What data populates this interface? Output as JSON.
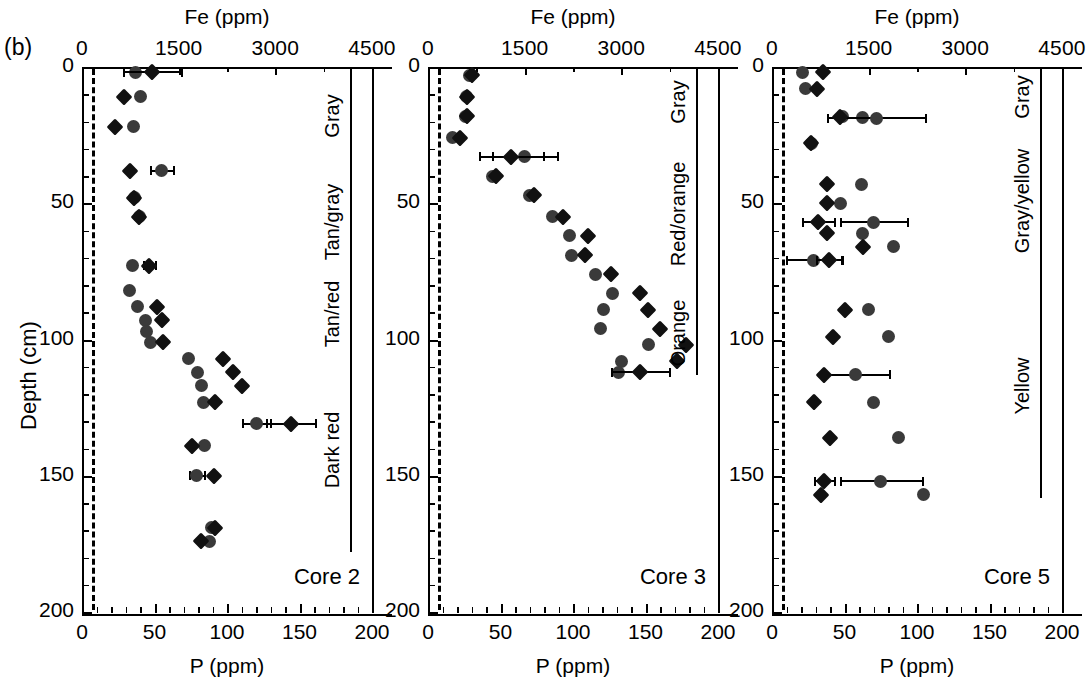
{
  "figure": {
    "panel_letter": "(b)",
    "y_axis_title": "Depth (cm)",
    "y_ticks": [
      "0",
      "50",
      "100",
      "150",
      "200"
    ],
    "y_tick_values": [
      0,
      50,
      100,
      150,
      200
    ],
    "y_minor_step": 10,
    "top_axis_title": "Fe (ppm)",
    "top_ticks": [
      "0",
      "1500",
      "3000",
      "4500"
    ],
    "top_tick_values": [
      0,
      1500,
      3000,
      4500
    ],
    "bottom_axis_title": "P (ppm)",
    "bottom_ticks": [
      "0",
      "50",
      "100",
      "150",
      "200"
    ],
    "bottom_tick_values": [
      0,
      50,
      100,
      150,
      200
    ],
    "bottom_minor_step": 10,
    "marker_fe_color": "#3a3a3a",
    "marker_p_color": "#111111",
    "detection_limit_P": 7
  },
  "chart_data": {
    "type": "scatter",
    "title": "",
    "xlabel": "P (ppm)",
    "ylabel": "Depth (cm)",
    "xlabel_top": "Fe (ppm)",
    "ylim": [
      0,
      200
    ],
    "xlim_bottom": [
      0,
      200
    ],
    "xlim_top": [
      0,
      4500
    ],
    "grid": false,
    "legend": "none",
    "y_inverted": true,
    "panels": [
      {
        "name": "Core 2",
        "zones": [
          {
            "label": "Gray",
            "top": 0,
            "bottom": 36
          },
          {
            "label": "Tan/gray",
            "top": 36,
            "bottom": 78
          },
          {
            "label": "Tan/red",
            "top": 78,
            "bottom": 103
          },
          {
            "label": "Dark red",
            "top": 103,
            "bottom": 178
          }
        ],
        "fe_series": {
          "name": "Fe (ppm)",
          "marker": "circle",
          "points": [
            {
              "depth": 2,
              "value": 830,
              "err": 0
            },
            {
              "depth": 11,
              "value": 900,
              "err": 0
            },
            {
              "depth": 22,
              "value": 800,
              "err": 0
            },
            {
              "depth": 38,
              "value": 1230,
              "err": 180
            },
            {
              "depth": 48,
              "value": 820,
              "err": 0
            },
            {
              "depth": 55,
              "value": 890,
              "err": 0
            },
            {
              "depth": 73,
              "value": 780,
              "err": 0
            },
            {
              "depth": 82,
              "value": 740,
              "err": 0
            },
            {
              "depth": 88,
              "value": 860,
              "err": 0
            },
            {
              "depth": 93,
              "value": 980,
              "err": 0
            },
            {
              "depth": 97,
              "value": 1000,
              "err": 0
            },
            {
              "depth": 101,
              "value": 1060,
              "err": 0
            },
            {
              "depth": 107,
              "value": 1660,
              "err": 0
            },
            {
              "depth": 112,
              "value": 1790,
              "err": 0
            },
            {
              "depth": 117,
              "value": 1860,
              "err": 0
            },
            {
              "depth": 123,
              "value": 1880,
              "err": 0
            },
            {
              "depth": 131,
              "value": 2700,
              "err": 220
            },
            {
              "depth": 139,
              "value": 1900,
              "err": 0
            },
            {
              "depth": 150,
              "value": 1780,
              "err": 120
            },
            {
              "depth": 169,
              "value": 2010,
              "err": 0
            },
            {
              "depth": 174,
              "value": 1980,
              "err": 0
            }
          ]
        },
        "p_series": {
          "name": "P (ppm)",
          "marker": "diamond",
          "points": [
            {
              "depth": 2,
              "value": 48,
              "err": 20
            },
            {
              "depth": 11,
              "value": 29,
              "err": 0
            },
            {
              "depth": 22,
              "value": 23,
              "err": 0
            },
            {
              "depth": 38,
              "value": 33,
              "err": 0
            },
            {
              "depth": 48,
              "value": 36,
              "err": 0
            },
            {
              "depth": 55,
              "value": 39,
              "err": 0
            },
            {
              "depth": 73,
              "value": 46,
              "err": 4
            },
            {
              "depth": 88,
              "value": 52,
              "err": 0
            },
            {
              "depth": 93,
              "value": 55,
              "err": 0
            },
            {
              "depth": 101,
              "value": 56,
              "err": 0
            },
            {
              "depth": 107,
              "value": 97,
              "err": 0
            },
            {
              "depth": 112,
              "value": 104,
              "err": 0
            },
            {
              "depth": 117,
              "value": 110,
              "err": 0
            },
            {
              "depth": 123,
              "value": 92,
              "err": 0
            },
            {
              "depth": 131,
              "value": 144,
              "err": 17
            },
            {
              "depth": 139,
              "value": 76,
              "err": 0
            },
            {
              "depth": 150,
              "value": 91,
              "err": 0
            },
            {
              "depth": 169,
              "value": 92,
              "err": 0
            },
            {
              "depth": 174,
              "value": 82,
              "err": 0
            }
          ]
        }
      },
      {
        "name": "Core 3",
        "zones": [
          {
            "label": "Gray",
            "top": 0,
            "bottom": 26
          },
          {
            "label": "Red/orange",
            "top": 26,
            "bottom": 82
          },
          {
            "label": "Orange",
            "top": 82,
            "bottom": 113
          }
        ],
        "fe_series": {
          "name": "Fe (ppm)",
          "marker": "circle",
          "points": [
            {
              "depth": 3,
              "value": 640,
              "err": 0
            },
            {
              "depth": 11,
              "value": 590,
              "err": 0
            },
            {
              "depth": 18,
              "value": 580,
              "err": 0
            },
            {
              "depth": 26,
              "value": 380,
              "err": 0
            },
            {
              "depth": 33,
              "value": 1500,
              "err": 500
            },
            {
              "depth": 40,
              "value": 1000,
              "err": 0
            },
            {
              "depth": 47,
              "value": 1580,
              "err": 0
            },
            {
              "depth": 55,
              "value": 1930,
              "err": 0
            },
            {
              "depth": 62,
              "value": 2200,
              "err": 0
            },
            {
              "depth": 69,
              "value": 2230,
              "err": 0
            },
            {
              "depth": 76,
              "value": 2600,
              "err": 0
            },
            {
              "depth": 83,
              "value": 2870,
              "err": 0
            },
            {
              "depth": 89,
              "value": 2730,
              "err": 0
            },
            {
              "depth": 96,
              "value": 2670,
              "err": 0
            },
            {
              "depth": 102,
              "value": 3420,
              "err": 0
            },
            {
              "depth": 108,
              "value": 3000,
              "err": 0
            },
            {
              "depth": 112,
              "value": 2960,
              "err": 0
            }
          ]
        },
        "p_series": {
          "name": "P (ppm)",
          "marker": "diamond",
          "points": [
            {
              "depth": 3,
              "value": 30,
              "err": 0
            },
            {
              "depth": 11,
              "value": 27,
              "err": 0
            },
            {
              "depth": 18,
              "value": 27,
              "err": 0
            },
            {
              "depth": 26,
              "value": 22,
              "err": 0
            },
            {
              "depth": 33,
              "value": 57,
              "err": 22
            },
            {
              "depth": 40,
              "value": 47,
              "err": 0
            },
            {
              "depth": 47,
              "value": 73,
              "err": 0
            },
            {
              "depth": 55,
              "value": 93,
              "err": 0
            },
            {
              "depth": 62,
              "value": 110,
              "err": 0
            },
            {
              "depth": 69,
              "value": 108,
              "err": 0
            },
            {
              "depth": 76,
              "value": 126,
              "err": 0
            },
            {
              "depth": 83,
              "value": 146,
              "err": 0
            },
            {
              "depth": 89,
              "value": 152,
              "err": 0
            },
            {
              "depth": 96,
              "value": 160,
              "err": 0
            },
            {
              "depth": 102,
              "value": 178,
              "err": 0
            },
            {
              "depth": 108,
              "value": 172,
              "err": 0
            },
            {
              "depth": 112,
              "value": 146,
              "err": 20
            }
          ]
        }
      },
      {
        "name": "Core 5",
        "zones": [
          {
            "label": "Gray",
            "top": 0,
            "bottom": 22
          },
          {
            "label": "Gray/yellow",
            "top": 22,
            "bottom": 76
          },
          {
            "label": "Yellow",
            "top": 76,
            "bottom": 158
          }
        ],
        "fe_series": {
          "name": "Fe (ppm)",
          "marker": "circle",
          "points": [
            {
              "depth": 2,
              "value": 470,
              "err": 0
            },
            {
              "depth": 8,
              "value": 520,
              "err": 0
            },
            {
              "depth": 18,
              "value": 1090,
              "err": 0
            },
            {
              "depth": 18.5,
              "value": 1400,
              "err": 0
            },
            {
              "depth": 18.8,
              "value": 1620,
              "err": 760
            },
            {
              "depth": 28,
              "value": 620,
              "err": 0
            },
            {
              "depth": 43,
              "value": 1390,
              "err": 0
            },
            {
              "depth": 50,
              "value": 1060,
              "err": 0
            },
            {
              "depth": 57,
              "value": 1580,
              "err": 520
            },
            {
              "depth": 61,
              "value": 1410,
              "err": 0
            },
            {
              "depth": 66,
              "value": 1880,
              "err": 0
            },
            {
              "depth": 71,
              "value": 640,
              "err": 430
            },
            {
              "depth": 89,
              "value": 1490,
              "err": 0
            },
            {
              "depth": 99,
              "value": 1800,
              "err": 0
            },
            {
              "depth": 113,
              "value": 1290,
              "err": 520
            },
            {
              "depth": 123,
              "value": 1580,
              "err": 0
            },
            {
              "depth": 136,
              "value": 1960,
              "err": 0
            },
            {
              "depth": 152,
              "value": 1690,
              "err": 640
            },
            {
              "depth": 157,
              "value": 2350,
              "err": 0
            }
          ]
        },
        "p_series": {
          "name": "P (ppm)",
          "marker": "diamond",
          "points": [
            {
              "depth": 2,
              "value": 35,
              "err": 0
            },
            {
              "depth": 8,
              "value": 31,
              "err": 0
            },
            {
              "depth": 18.5,
              "value": 47,
              "err": 0
            },
            {
              "depth": 28,
              "value": 27,
              "err": 0
            },
            {
              "depth": 43,
              "value": 38,
              "err": 0
            },
            {
              "depth": 50,
              "value": 38,
              "err": 0
            },
            {
              "depth": 57,
              "value": 32,
              "err": 11
            },
            {
              "depth": 61,
              "value": 38,
              "err": 0
            },
            {
              "depth": 66,
              "value": 63,
              "err": 0
            },
            {
              "depth": 71,
              "value": 39,
              "err": 9
            },
            {
              "depth": 89,
              "value": 50,
              "err": 0
            },
            {
              "depth": 99,
              "value": 42,
              "err": 0
            },
            {
              "depth": 113,
              "value": 36,
              "err": 0
            },
            {
              "depth": 123,
              "value": 29,
              "err": 0
            },
            {
              "depth": 136,
              "value": 40,
              "err": 0
            },
            {
              "depth": 152,
              "value": 36,
              "err": 7
            },
            {
              "depth": 157,
              "value": 34,
              "err": 0
            }
          ]
        }
      }
    ]
  }
}
